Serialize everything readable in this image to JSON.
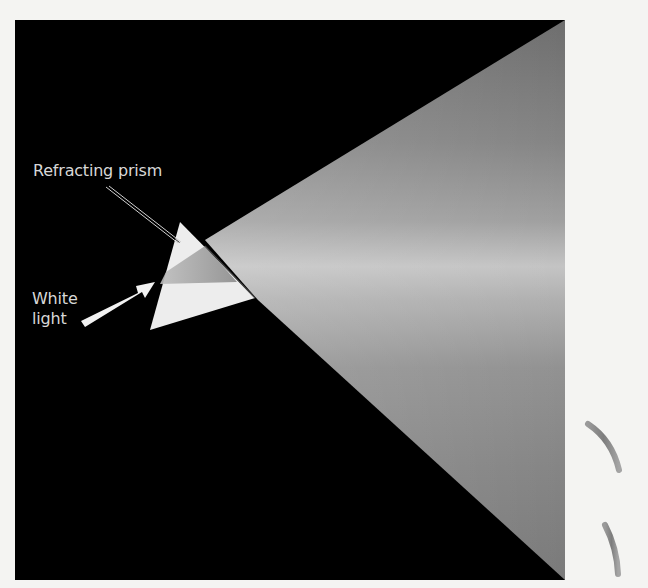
{
  "figure": {
    "background_color": "#f4f4f2",
    "panel_color": "#000000"
  },
  "labels": {
    "refracting_prism": "Refracting prism",
    "white_light_line1": "White",
    "white_light_line2": "light"
  },
  "colors": {
    "beam_mid": "#b8b8b8",
    "beam_edge": "#7a7a7a",
    "prism_face": "#ececec",
    "arrow": "#f2f2f2",
    "label_text": "#d8d8d8",
    "side_marks": "#8a8a8a"
  },
  "side_marks": {
    "count": 7,
    "shapes": [
      "straight",
      "straight",
      "straight",
      "straight",
      "straight",
      "curved",
      "curved"
    ]
  }
}
